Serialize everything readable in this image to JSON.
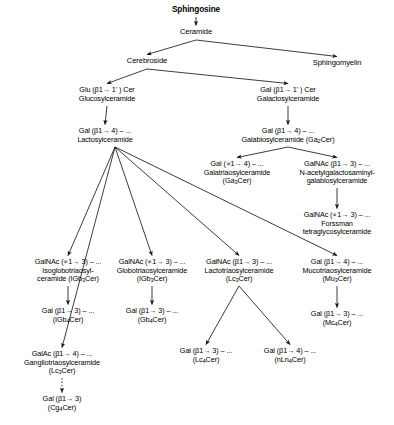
{
  "diagram": {
    "background": "#ffffff",
    "stroke": "#1a1a1a",
    "nodes": {
      "sphingosine": {
        "lines": [
          "Sphingosine"
        ]
      },
      "ceramide": {
        "lines": [
          "Ceramide"
        ]
      },
      "cerebroside": {
        "lines": [
          "Cerebroside"
        ]
      },
      "sphingomyelin": {
        "lines": [
          "Sphingomyelin"
        ]
      },
      "glucosylceramide": {
        "lines": [
          "Glu (β1→ 1' ) Cer",
          "Glucosylceramide"
        ]
      },
      "galactosylceramide": {
        "lines": [
          "Gal (β1→ 1' ) Cer",
          "Galactosylceramide"
        ]
      },
      "lactosylceramide": {
        "lines": [
          "Gal (β1→ 4) – ...",
          "Lactosylceramide"
        ]
      },
      "galabiosylceramide": {
        "lines": [
          "Gal (β1→ 4) – ...",
          "Galabiosylceramide (Ga|2|Cer)"
        ]
      },
      "galatriaosylceramide": {
        "lines": [
          "Gal (∝1→ 4) – ...",
          "Galatriaosylceramide",
          "(Ga|3|Cer)"
        ]
      },
      "nacetylgalactosaminyl": {
        "lines": [
          "GalNAc (β1→ 3) – ...",
          "N-acetylgalactosaminyl-",
          "galabiosylceramide"
        ]
      },
      "forssman": {
        "lines": [
          "GalNAc (∝1→ 3) – ...",
          "Forssman",
          "tetraglycosylceramide"
        ]
      },
      "isoglobotriaosylceramide": {
        "lines": [
          "GalNAc (∝1→ 3) – ...",
          "Isoglobotriaosyl-",
          "ceramide (IGb|3|Cer)"
        ]
      },
      "igb4cer": {
        "lines": [
          "Gal (β1→ 3) – ...",
          "(IGb|4|Cer)"
        ]
      },
      "gangliotriaosylceramide": {
        "lines": [
          "GalAc (β1→ 4) – ...",
          "Gangliotriaosylceramide",
          "(Lc|3|Cer)"
        ]
      },
      "cg4cer": {
        "lines": [
          "Gal (β1→ 3)",
          "(Cg|4|Cer)"
        ]
      },
      "globotriaosylceramide": {
        "lines": [
          "GalNAc (∝1→ 3) – ...",
          "Globotriaosylceramide",
          "(IGb|3|Cer)"
        ]
      },
      "gb4cer": {
        "lines": [
          "Gal (β1→ 3) – ...",
          "(Gb|4|Cer)"
        ]
      },
      "lactotriaosylceramide": {
        "lines": [
          "GalNAc (β1→ 3) – ...",
          "Lactotriaosylceramide",
          "(Lc|3|Cer)"
        ]
      },
      "lc4cer": {
        "lines": [
          "Gal (β1→ 3) – ...",
          "(Lc|4|Cer)"
        ]
      },
      "nln4cer": {
        "lines": [
          "Gal (β1→ 4) – ...",
          "(nLn|4|Cer)"
        ]
      },
      "mucotriaosylceramide": {
        "lines": [
          "Gal (β1→ 4) – ...",
          "Mucotriaosylceramide",
          "(Mu|3|Cer)"
        ]
      },
      "mc4cer": {
        "lines": [
          "Gal (β1→ 3) – ...",
          "(Mc|4|Cer)"
        ]
      }
    },
    "edges": [
      {
        "from": "sphingosine",
        "to": "ceramide",
        "style": "solid"
      },
      {
        "from": "ceramide",
        "to": "cerebroside",
        "style": "solid"
      },
      {
        "from": "ceramide",
        "to": "sphingomyelin",
        "style": "solid"
      },
      {
        "from": "cerebroside",
        "to": "glucosylceramide",
        "style": "solid"
      },
      {
        "from": "cerebroside",
        "to": "galactosylceramide",
        "style": "solid"
      },
      {
        "from": "glucosylceramide",
        "to": "lactosylceramide",
        "style": "solid"
      },
      {
        "from": "galactosylceramide",
        "to": "galabiosylceramide",
        "style": "solid"
      },
      {
        "from": "galabiosylceramide",
        "to": "galatriaosylceramide",
        "style": "solid"
      },
      {
        "from": "galabiosylceramide",
        "to": "nacetylgalactosaminyl",
        "style": "solid"
      },
      {
        "from": "nacetylgalactosaminyl",
        "to": "forssman",
        "style": "solid"
      },
      {
        "from": "lactosylceramide",
        "to": "gangliotriaosylceramide",
        "style": "solid"
      },
      {
        "from": "lactosylceramide",
        "to": "isoglobotriaosylceramide",
        "style": "solid"
      },
      {
        "from": "lactosylceramide",
        "to": "globotriaosylceramide",
        "style": "solid"
      },
      {
        "from": "lactosylceramide",
        "to": "lactotriaosylceramide",
        "style": "solid"
      },
      {
        "from": "lactosylceramide",
        "to": "mucotriaosylceramide",
        "style": "solid"
      },
      {
        "from": "isoglobotriaosylceramide",
        "to": "igb4cer",
        "style": "solid"
      },
      {
        "from": "gangliotriaosylceramide",
        "to": "cg4cer",
        "style": "dashed"
      },
      {
        "from": "globotriaosylceramide",
        "to": "gb4cer",
        "style": "solid"
      },
      {
        "from": "lactotriaosylceramide",
        "to": "lc4cer",
        "style": "solid"
      },
      {
        "from": "lactotriaosylceramide",
        "to": "nln4cer",
        "style": "solid"
      },
      {
        "from": "mucotriaosylceramide",
        "to": "mc4cer",
        "style": "solid"
      }
    ]
  }
}
